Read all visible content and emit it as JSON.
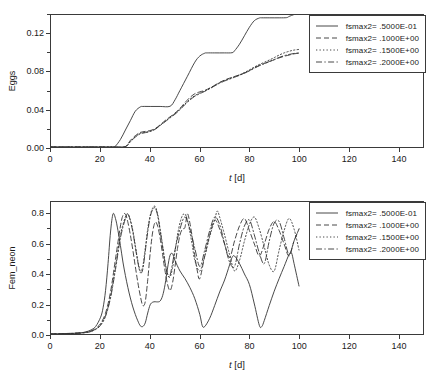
{
  "figure": {
    "panels": [
      "top",
      "bottom"
    ]
  },
  "chart_data": [
    {
      "id": "eggs-chart",
      "type": "line",
      "title": "",
      "xlabel": "t [d]",
      "ylabel": "Eggs",
      "xlim": [
        0,
        150
      ],
      "ylim": [
        0,
        0.14
      ],
      "xticks": [
        0,
        20,
        40,
        60,
        80,
        100,
        120,
        140
      ],
      "xticklabels": [
        "0",
        "20",
        "40",
        "60",
        "80",
        "100",
        "120",
        "140"
      ],
      "yticks": [
        0.0,
        0.04,
        0.08,
        0.12
      ],
      "yticklabels": [
        "0.00",
        "0.04",
        "0.08",
        "0.12"
      ],
      "grid": false,
      "legend_position": "upper right",
      "series": [
        {
          "name": "fsmax2= .5000E-01",
          "linestyle": "solid",
          "color": "#333333",
          "x": [
            0,
            10,
            20,
            25,
            26,
            28,
            30,
            32,
            34,
            36,
            37,
            40,
            44,
            48,
            50,
            52,
            55,
            58,
            60,
            62,
            63,
            66,
            70,
            73,
            74,
            76,
            78,
            80,
            82,
            84,
            85,
            88,
            92,
            95,
            96,
            97,
            98,
            99,
            100
          ],
          "y": [
            0.0,
            0.0,
            0.0,
            0.0,
            0.001,
            0.008,
            0.018,
            0.028,
            0.038,
            0.0425,
            0.043,
            0.043,
            0.043,
            0.0432,
            0.05,
            0.06,
            0.075,
            0.09,
            0.0965,
            0.0995,
            0.0998,
            0.0998,
            0.0998,
            0.1,
            0.102,
            0.109,
            0.118,
            0.127,
            0.134,
            0.1368,
            0.137,
            0.137,
            0.137,
            0.1372,
            0.1385,
            0.1395,
            0.1405,
            0.141,
            0.1415
          ]
        },
        {
          "name": "fsmax2= .1000E+00",
          "linestyle": "dashed",
          "color": "#333333",
          "x": [
            0,
            20,
            28,
            30,
            31,
            32,
            34,
            36,
            38,
            40,
            42,
            44,
            46,
            48,
            50,
            52,
            54,
            56,
            58,
            60,
            62,
            64,
            66,
            68,
            70,
            72,
            74,
            76,
            78,
            80,
            82,
            84,
            86,
            88,
            90,
            92,
            94,
            96,
            98,
            100
          ],
          "y": [
            0.0,
            0.0,
            0.0,
            0.0005,
            0.003,
            0.007,
            0.012,
            0.0155,
            0.0165,
            0.0175,
            0.0195,
            0.0235,
            0.028,
            0.032,
            0.036,
            0.041,
            0.047,
            0.0525,
            0.0565,
            0.0585,
            0.06,
            0.0625,
            0.0655,
            0.0685,
            0.071,
            0.073,
            0.0748,
            0.0765,
            0.0785,
            0.081,
            0.084,
            0.0865,
            0.0885,
            0.0905,
            0.0925,
            0.0945,
            0.0962,
            0.0975,
            0.0988,
            0.0995
          ]
        },
        {
          "name": "fsmax2= .1500E+00",
          "linestyle": "dotted",
          "color": "#333333",
          "x": [
            0,
            20,
            28,
            30,
            31,
            32,
            34,
            36,
            38,
            40,
            42,
            44,
            46,
            48,
            50,
            52,
            54,
            56,
            58,
            60,
            62,
            64,
            66,
            68,
            70,
            72,
            74,
            76,
            78,
            80,
            82,
            84,
            86,
            88,
            90,
            92,
            94,
            96,
            98,
            100
          ],
          "y": [
            0.0,
            0.0,
            0.0,
            0.0004,
            0.0025,
            0.006,
            0.011,
            0.0145,
            0.0155,
            0.0168,
            0.019,
            0.023,
            0.0272,
            0.0315,
            0.0355,
            0.04,
            0.0455,
            0.0505,
            0.0545,
            0.0572,
            0.0595,
            0.0622,
            0.0652,
            0.0682,
            0.0706,
            0.0725,
            0.0745,
            0.0765,
            0.079,
            0.0818,
            0.0848,
            0.0875,
            0.0898,
            0.0922,
            0.0948,
            0.0975,
            0.0998,
            0.1015,
            0.1028,
            0.1035
          ]
        },
        {
          "name": "fsmax2= .2000E+00",
          "linestyle": "dashdot",
          "color": "#333333",
          "x": [
            0,
            20,
            28,
            30,
            31,
            32,
            34,
            36,
            38,
            40,
            42,
            44,
            46,
            48,
            50,
            52,
            54,
            56,
            58,
            60,
            62,
            64,
            66,
            68,
            70,
            72,
            74,
            76,
            78,
            80,
            82,
            84,
            86,
            88,
            90,
            92,
            94,
            96,
            98,
            100
          ],
          "y": [
            0.0,
            0.0,
            0.0,
            0.0003,
            0.0022,
            0.0055,
            0.0105,
            0.014,
            0.0152,
            0.0165,
            0.0188,
            0.0228,
            0.0268,
            0.0308,
            0.0348,
            0.0395,
            0.045,
            0.0498,
            0.0538,
            0.0566,
            0.059,
            0.0618,
            0.0648,
            0.0676,
            0.07,
            0.072,
            0.074,
            0.076,
            0.0782,
            0.0808,
            0.0836,
            0.0862,
            0.0884,
            0.0906,
            0.0928,
            0.095,
            0.0968,
            0.0982,
            0.0992,
            0.0998
          ]
        }
      ]
    },
    {
      "id": "fem-neon-chart",
      "type": "line",
      "title": "",
      "xlabel": "t [d]",
      "ylabel": "Fem_neon",
      "xlim": [
        0,
        150
      ],
      "ylim": [
        0,
        0.88
      ],
      "xticks": [
        0,
        20,
        40,
        60,
        80,
        100,
        120,
        140
      ],
      "xticklabels": [
        "0",
        "20",
        "40",
        "60",
        "80",
        "100",
        "120",
        "140"
      ],
      "yticks": [
        0.0,
        0.2,
        0.4,
        0.6,
        0.8
      ],
      "yticklabels": [
        "0.0",
        "0.2",
        "0.4",
        "0.6",
        "0.8"
      ],
      "grid": false,
      "legend_position": "upper right",
      "series": [
        {
          "name": "fsmax2= .5000E-01",
          "linestyle": "solid",
          "color": "#333333",
          "x": [
            0,
            8,
            12,
            14,
            16,
            18,
            20,
            21,
            22,
            23,
            24,
            25,
            26,
            27,
            28,
            29,
            30,
            31,
            32,
            33,
            34,
            35,
            36,
            37,
            38,
            39,
            40,
            41,
            42,
            43,
            44,
            45,
            46,
            47,
            48,
            49,
            50,
            52,
            54,
            56,
            58,
            60,
            61,
            62,
            64,
            66,
            68,
            70,
            72,
            73,
            74,
            76,
            78,
            80,
            82,
            84,
            85,
            86,
            88,
            90,
            92,
            94,
            96,
            97,
            98,
            100
          ],
          "y": [
            0.0,
            0.003,
            0.008,
            0.014,
            0.026,
            0.05,
            0.112,
            0.175,
            0.29,
            0.47,
            0.68,
            0.8,
            0.77,
            0.69,
            0.59,
            0.48,
            0.39,
            0.31,
            0.24,
            0.18,
            0.13,
            0.088,
            0.055,
            0.05,
            0.074,
            0.14,
            0.195,
            0.212,
            0.215,
            0.214,
            0.22,
            0.255,
            0.33,
            0.44,
            0.525,
            0.535,
            0.49,
            0.42,
            0.37,
            0.31,
            0.235,
            0.13,
            0.055,
            0.05,
            0.105,
            0.19,
            0.28,
            0.36,
            0.46,
            0.51,
            0.52,
            0.47,
            0.4,
            0.33,
            0.2,
            0.058,
            0.05,
            0.09,
            0.19,
            0.285,
            0.37,
            0.45,
            0.53,
            0.54,
            0.47,
            0.32
          ]
        },
        {
          "name": "fsmax2= .1000E+00",
          "linestyle": "dashed",
          "color": "#333333",
          "x": [
            0,
            10,
            14,
            16,
            18,
            20,
            22,
            24,
            26,
            28,
            29,
            30,
            31,
            32,
            33,
            34,
            35,
            36,
            37,
            38,
            39,
            40,
            41,
            42,
            43,
            44,
            45,
            46,
            47,
            48,
            49,
            50,
            51,
            52,
            53,
            54,
            55,
            56,
            57,
            58,
            59,
            60,
            62,
            64,
            66,
            68,
            70,
            72,
            74,
            76,
            78,
            80,
            82,
            84,
            86,
            88,
            90,
            92,
            94,
            96,
            98,
            100
          ],
          "y": [
            0.0,
            0.006,
            0.012,
            0.02,
            0.036,
            0.07,
            0.14,
            0.28,
            0.5,
            0.72,
            0.79,
            0.8,
            0.745,
            0.66,
            0.56,
            0.45,
            0.345,
            0.255,
            0.19,
            0.215,
            0.36,
            0.54,
            0.68,
            0.745,
            0.72,
            0.64,
            0.53,
            0.42,
            0.33,
            0.29,
            0.34,
            0.45,
            0.57,
            0.66,
            0.7,
            0.71,
            0.8,
            0.74,
            0.64,
            0.52,
            0.42,
            0.37,
            0.52,
            0.66,
            0.76,
            0.7,
            0.6,
            0.51,
            0.62,
            0.72,
            0.77,
            0.69,
            0.6,
            0.52,
            0.6,
            0.7,
            0.75,
            0.69,
            0.6,
            0.52,
            0.62,
            0.7
          ]
        },
        {
          "name": "fsmax2= .1500E+00",
          "linestyle": "dotted",
          "color": "#333333",
          "x": [
            0,
            10,
            14,
            16,
            18,
            20,
            22,
            24,
            26,
            28,
            30,
            31,
            32,
            33,
            34,
            35,
            36,
            37,
            38,
            39,
            40,
            41,
            42,
            43,
            44,
            45,
            46,
            47,
            48,
            49,
            50,
            51,
            52,
            53,
            54,
            55,
            56,
            57,
            58,
            60,
            62,
            64,
            66,
            67,
            68,
            70,
            72,
            74,
            76,
            78,
            80,
            82,
            84,
            86,
            88,
            90,
            92,
            94,
            96,
            98,
            100
          ],
          "y": [
            0.0,
            0.005,
            0.01,
            0.018,
            0.032,
            0.062,
            0.125,
            0.25,
            0.45,
            0.66,
            0.78,
            0.8,
            0.76,
            0.69,
            0.59,
            0.49,
            0.42,
            0.45,
            0.57,
            0.7,
            0.79,
            0.84,
            0.85,
            0.8,
            0.7,
            0.59,
            0.48,
            0.4,
            0.38,
            0.44,
            0.55,
            0.66,
            0.74,
            0.79,
            0.8,
            0.76,
            0.68,
            0.59,
            0.49,
            0.42,
            0.52,
            0.65,
            0.76,
            0.82,
            0.78,
            0.66,
            0.53,
            0.42,
            0.49,
            0.62,
            0.73,
            0.78,
            0.7,
            0.58,
            0.46,
            0.42,
            0.56,
            0.69,
            0.77,
            0.7,
            0.56
          ]
        },
        {
          "name": "fsmax2= .2000E+00",
          "linestyle": "dashdot",
          "color": "#333333",
          "x": [
            0,
            10,
            14,
            16,
            18,
            20,
            22,
            24,
            26,
            28,
            30,
            31,
            32,
            33,
            34,
            35,
            36,
            37,
            38,
            39,
            40,
            41,
            42,
            43,
            44,
            45,
            46,
            47,
            48,
            50,
            52,
            54,
            56,
            58,
            60,
            62,
            64,
            66,
            68,
            70,
            72,
            74,
            76,
            78,
            80,
            82,
            84,
            86,
            88,
            90,
            92,
            94,
            96,
            98,
            100
          ],
          "y": [
            0.0,
            0.004,
            0.009,
            0.016,
            0.03,
            0.058,
            0.118,
            0.24,
            0.43,
            0.64,
            0.77,
            0.8,
            0.755,
            0.68,
            0.58,
            0.48,
            0.41,
            0.43,
            0.55,
            0.68,
            0.78,
            0.83,
            0.84,
            0.79,
            0.69,
            0.58,
            0.47,
            0.4,
            0.39,
            0.56,
            0.7,
            0.78,
            0.7,
            0.57,
            0.45,
            0.56,
            0.69,
            0.78,
            0.73,
            0.6,
            0.48,
            0.45,
            0.6,
            0.72,
            0.76,
            0.66,
            0.54,
            0.47,
            0.62,
            0.74,
            0.75,
            0.64,
            0.53,
            0.62,
            0.7
          ]
        }
      ]
    }
  ],
  "legend": {
    "entries": [
      {
        "label": "fsmax2= .5000E-01",
        "style": "solid"
      },
      {
        "label": "fsmax2= .1000E+00",
        "style": "dashed"
      },
      {
        "label": "fsmax2= .1500E+00",
        "style": "dotted"
      },
      {
        "label": "fsmax2= .2000E+00",
        "style": "dashdot"
      }
    ]
  },
  "style": {
    "line_color": "#333333",
    "axis_color": "#3a3a3a",
    "background": "#ffffff"
  }
}
